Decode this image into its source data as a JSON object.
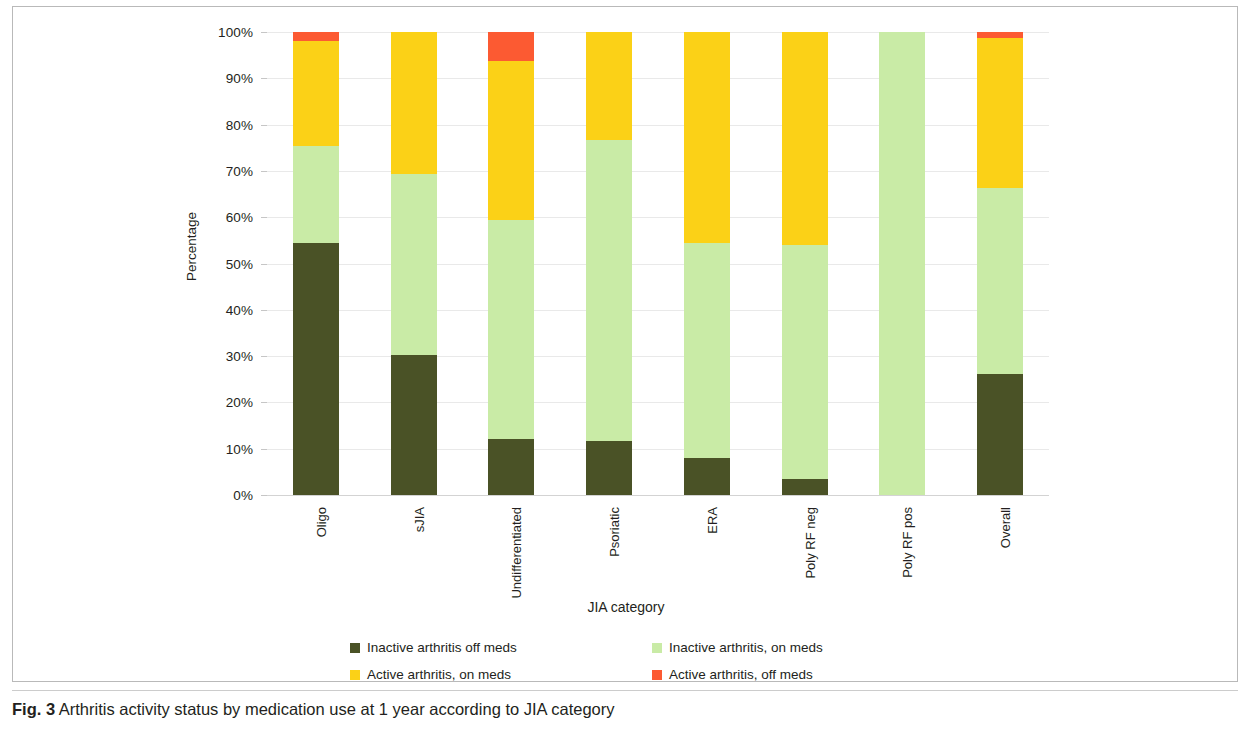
{
  "figure": {
    "caption_label": "Fig. 3",
    "caption_text": "Arthritis activity status by medication use at 1 year according to JIA category"
  },
  "colors": {
    "inactive_off_meds": "#4a5226",
    "inactive_on_meds": "#c9eba6",
    "active_on_meds": "#fbd117",
    "active_off_meds": "#fc5a32",
    "gridline": "#e9e9e9",
    "text": "#231f20"
  },
  "chart_data": {
    "type": "bar",
    "stacked": true,
    "title": "",
    "xlabel": "JIA category",
    "ylabel": "Percentage",
    "ylim": [
      0,
      100
    ],
    "ytick_labels": [
      "0%",
      "10%",
      "20%",
      "30%",
      "40%",
      "50%",
      "60%",
      "70%",
      "80%",
      "90%",
      "100%"
    ],
    "ytick_values": [
      0,
      10,
      20,
      30,
      40,
      50,
      60,
      70,
      80,
      90,
      100
    ],
    "grid": true,
    "legend_position": "bottom",
    "categories": [
      "Oligo",
      "sJIA",
      "Undifferentiated",
      "Psoriatic",
      "ERA",
      "Poly RF neg",
      "Poly RF pos",
      "Overall"
    ],
    "series": [
      {
        "name": "Inactive arthritis off meds",
        "color": "#4a5226",
        "values": [
          54.5,
          30.3,
          12.0,
          11.6,
          8.0,
          3.5,
          0.0,
          26.1
        ]
      },
      {
        "name": "Inactive arthritis, on meds",
        "color": "#c9eba6",
        "values": [
          20.8,
          39.0,
          47.3,
          65.1,
          46.5,
          50.5,
          100.0,
          40.2
        ]
      },
      {
        "name": "Active arthritis, on meds",
        "color": "#fbd117",
        "values": [
          22.8,
          30.7,
          34.5,
          23.3,
          45.5,
          46.0,
          0.0,
          32.5
        ]
      },
      {
        "name": "Active arthritis, off meds",
        "color": "#fc5a32",
        "values": [
          1.9,
          0.0,
          6.2,
          0.0,
          0.0,
          0.0,
          0.0,
          1.2
        ]
      }
    ]
  },
  "legend": {
    "items": [
      {
        "label": "Inactive arthritis off meds",
        "color": "#4a5226"
      },
      {
        "label": "Inactive arthritis, on meds",
        "color": "#c9eba6"
      },
      {
        "label": "Active arthritis, on meds",
        "color": "#fbd117"
      },
      {
        "label": "Active arthritis, off meds",
        "color": "#fc5a32"
      }
    ]
  }
}
